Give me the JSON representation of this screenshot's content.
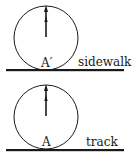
{
  "panels": [
    {
      "id": "top",
      "surface_label": "sidewalk",
      "contact_point_label": "A′",
      "circle": {
        "cx": 46,
        "cy": 38,
        "r": 32
      },
      "ground_y": 70,
      "arrow": {
        "x": 46,
        "y1": 37,
        "y2": 7,
        "mid_arrow_y": 18
      }
    },
    {
      "id": "bottom",
      "surface_label": "track",
      "contact_point_label": "A",
      "circle": {
        "cx": 46,
        "cy": 117,
        "r": 32
      },
      "ground_y": 150,
      "arrow": {
        "x": 46,
        "y1": 116,
        "y2": 86,
        "mid_arrow_y": 97
      }
    }
  ],
  "colors": {
    "ink": "#1a1a1a",
    "background": "#ffffff"
  }
}
